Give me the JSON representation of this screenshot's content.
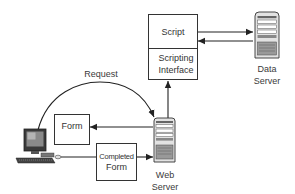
{
  "diagram": {
    "script_box": {
      "top_label": "Script",
      "bottom_label": "Scripting Interface"
    },
    "data_server": {
      "label": "Data Server",
      "icon": "server-tower-icon"
    },
    "web_server": {
      "label": "Web Server",
      "icon": "server-tower-icon"
    },
    "client": {
      "icon": "desktop-computer-icon"
    },
    "form_box": {
      "label": "Form"
    },
    "completed_form_box": {
      "label_line1": "Completed",
      "label_line2": "Form"
    },
    "request_label": "Request",
    "colors": {
      "line": "#2a2a2a",
      "box_border": "#333333",
      "server_body": "#e6e6e6",
      "server_dark": "#555555",
      "background": "#ffffff"
    }
  }
}
